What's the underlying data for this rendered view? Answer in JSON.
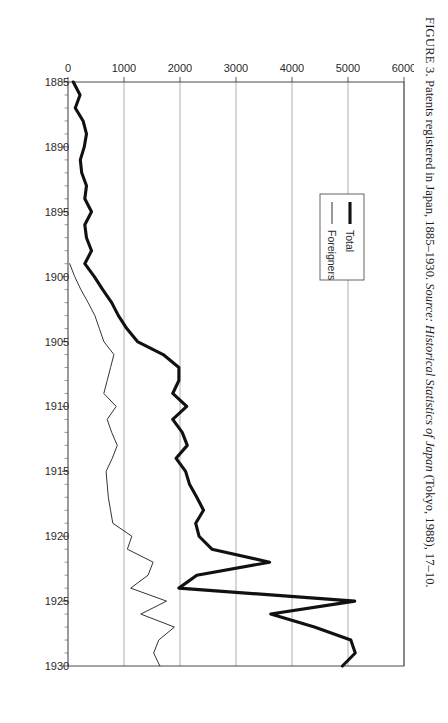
{
  "figure": {
    "label": "FIGURE 3.",
    "title_text": "Patents registered in Japan, 1885–1930.",
    "source_prefix": "Source:",
    "source_italic": "Historical Statistics of Japan",
    "source_rest": "(Tokyo, 1988), 17–10.",
    "orientation": "rotated-90-clockwise"
  },
  "legend": {
    "position": "inside-left",
    "entries": [
      {
        "label": "Total",
        "color": "#111111",
        "style": "thick-solid"
      },
      {
        "label": "Foreigners",
        "color": "#333333",
        "style": "thin-solid"
      }
    ]
  },
  "chart_data": {
    "type": "line",
    "title": "Patents registered in Japan, 1885–1930",
    "xlabel": "",
    "ylabel": "",
    "xlim": [
      1885,
      1930
    ],
    "ylim": [
      0,
      6000
    ],
    "grid": true,
    "x_tick_labels": [
      "1885",
      "1890",
      "1895",
      "1900",
      "1905",
      "1910",
      "1915",
      "1920",
      "1925",
      "1930"
    ],
    "x_ticks": [
      1885,
      1890,
      1895,
      1900,
      1905,
      1910,
      1915,
      1920,
      1925,
      1930
    ],
    "x_minor_step": 1,
    "y_tick_labels": [
      "0",
      "1000",
      "2000",
      "3000",
      "4000",
      "5000",
      "6000"
    ],
    "y_ticks": [
      0,
      1000,
      2000,
      3000,
      4000,
      5000,
      6000
    ],
    "x": [
      1885,
      1886,
      1887,
      1888,
      1889,
      1890,
      1891,
      1892,
      1893,
      1894,
      1895,
      1896,
      1897,
      1898,
      1899,
      1900,
      1901,
      1902,
      1903,
      1904,
      1905,
      1906,
      1907,
      1908,
      1909,
      1910,
      1911,
      1912,
      1913,
      1914,
      1915,
      1916,
      1917,
      1918,
      1919,
      1920,
      1921,
      1922,
      1923,
      1924,
      1925,
      1926,
      1927,
      1928,
      1929,
      1930
    ],
    "series": [
      {
        "name": "Total",
        "color": "#111111",
        "values": [
          95,
          215,
          130,
          270,
          330,
          290,
          220,
          245,
          330,
          300,
          420,
          300,
          330,
          420,
          300,
          470,
          620,
          780,
          900,
          1050,
          1240,
          1700,
          1980,
          1980,
          1870,
          2120,
          1870,
          2040,
          2130,
          1930,
          2100,
          2170,
          2300,
          2420,
          2280,
          2340,
          2570,
          3600,
          2300,
          1980,
          5120,
          3620,
          4400,
          5050,
          5130,
          4900
        ]
      },
      {
        "name": "Foreigners",
        "color": "#333333",
        "values": [
          0,
          0,
          0,
          0,
          0,
          0,
          0,
          0,
          0,
          0,
          0,
          0,
          0,
          0,
          30,
          120,
          230,
          360,
          480,
          560,
          640,
          820,
          760,
          700,
          640,
          860,
          700,
          780,
          880,
          790,
          680,
          700,
          720,
          760,
          800,
          1140,
          1060,
          1520,
          1430,
          1120,
          1760,
          1300,
          1900,
          1620,
          1530,
          1640
        ]
      }
    ]
  }
}
